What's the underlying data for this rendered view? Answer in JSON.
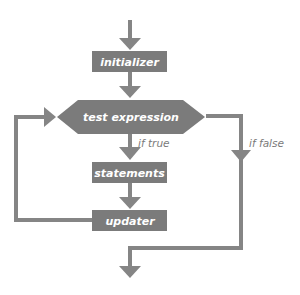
{
  "diagram": {
    "type": "flowchart",
    "colors": {
      "node_fill": "#7b7b7b",
      "line": "#858585",
      "node_text": "#ffffff",
      "edge_label": "#7a7a7a"
    },
    "nodes": [
      {
        "id": "initializer",
        "label": "initializer",
        "shape": "rectangle"
      },
      {
        "id": "test",
        "label": "test expression",
        "shape": "hexagon"
      },
      {
        "id": "statements",
        "label": "statements",
        "shape": "rectangle"
      },
      {
        "id": "updater",
        "label": "updater",
        "shape": "rectangle"
      }
    ],
    "edges": [
      {
        "from": "start",
        "to": "initializer",
        "label": ""
      },
      {
        "from": "initializer",
        "to": "test",
        "label": ""
      },
      {
        "from": "test",
        "to": "statements",
        "label": "if true"
      },
      {
        "from": "statements",
        "to": "updater",
        "label": ""
      },
      {
        "from": "updater",
        "to": "test",
        "label": ""
      },
      {
        "from": "test",
        "to": "end",
        "label": "if false"
      }
    ],
    "labels": {
      "initializer": "initializer",
      "test": "test expression",
      "statements": "statements",
      "updater": "updater",
      "if_true": "if true",
      "if_false": "if false"
    }
  }
}
